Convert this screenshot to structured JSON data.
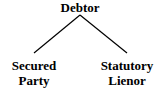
{
  "diagram": {
    "type": "tree",
    "root": {
      "label": "Debtor"
    },
    "children": [
      {
        "line1": "Secured",
        "line2": "Party"
      },
      {
        "line1": "Statutory",
        "line2": "Lienor"
      }
    ],
    "edges": [
      {
        "from": "Debtor",
        "to": "Secured Party"
      },
      {
        "from": "Debtor",
        "to": "Statutory Lienor"
      }
    ],
    "line_color": "#000000"
  }
}
